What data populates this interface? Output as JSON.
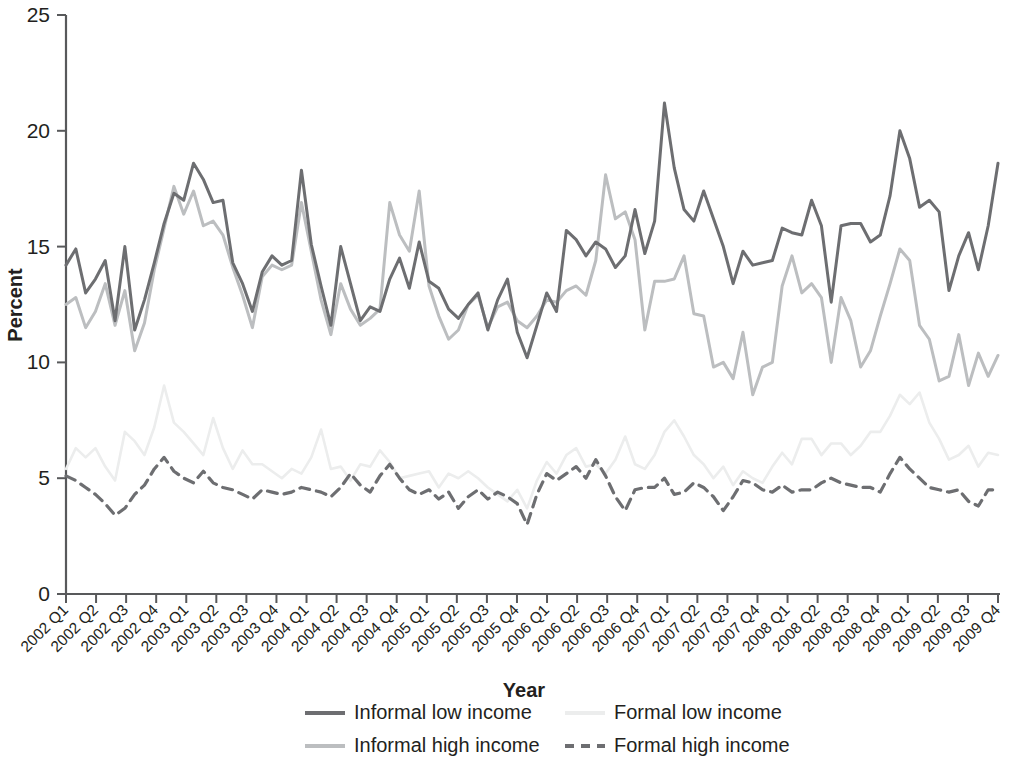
{
  "chart_data": {
    "type": "line",
    "title": "",
    "xlabel": "Year",
    "ylabel": "Percent",
    "ylim": [
      0,
      25
    ],
    "yticks": [
      0,
      5,
      10,
      15,
      20,
      25
    ],
    "grid": false,
    "legend_position": "bottom",
    "x_tick_labels": [
      "2002 Q1",
      "2002 Q2",
      "2002 Q3",
      "2002 Q4",
      "2003 Q1",
      "2003 Q2",
      "2003 Q3",
      "2003 Q4",
      "2004 Q1",
      "2004 Q2",
      "2004 Q3",
      "2004 Q4",
      "2005 Q1",
      "2005 Q2",
      "2005 Q3",
      "2005 Q4",
      "2006 Q1",
      "2006 Q2",
      "2006 Q3",
      "2006 Q4",
      "2007 Q1",
      "2007 Q2",
      "2007 Q3",
      "2007 Q4",
      "2008 Q1",
      "2008 Q2",
      "2008 Q3",
      "2008 Q4",
      "2009 Q1",
      "2009 Q2",
      "2009 Q3",
      "2009 Q4"
    ],
    "x_resolution_note": "monthly observations plotted; axis labelled by quarter",
    "series": [
      {
        "name": "Informal low income",
        "color": "#6d6e71",
        "width": 3.0,
        "dash": "none",
        "values": [
          14.2,
          14.9,
          13.0,
          13.6,
          14.4,
          11.8,
          15.0,
          11.4,
          12.7,
          14.3,
          16.0,
          17.3,
          17.0,
          18.6,
          17.9,
          16.9,
          17.0,
          14.3,
          13.4,
          12.2,
          13.9,
          14.6,
          14.2,
          14.4,
          18.3,
          15.1,
          13.3,
          11.6,
          15.0,
          13.4,
          11.8,
          12.4,
          12.2,
          13.6,
          14.5,
          13.2,
          15.2,
          13.5,
          13.2,
          12.3,
          11.9,
          12.5,
          13.0,
          11.4,
          12.7,
          13.6,
          11.3,
          10.2,
          11.6,
          13.0,
          12.2,
          15.7,
          15.3,
          14.6,
          15.2,
          14.9,
          14.1,
          14.6,
          16.6,
          14.7,
          16.1,
          21.2,
          18.4,
          16.6,
          16.1,
          17.4,
          16.2,
          15.0,
          13.4,
          14.8,
          14.2,
          14.3,
          14.4,
          15.8,
          15.6,
          15.5,
          17.0,
          15.9,
          12.6,
          15.9,
          16.0,
          16.0,
          15.2,
          15.5,
          17.2,
          20.0,
          18.8,
          16.7,
          17.0,
          16.5,
          13.1,
          14.6,
          15.6,
          14.0,
          15.9,
          18.6
        ]
      },
      {
        "name": "Informal high income",
        "color": "#bcbec0",
        "width": 3.0,
        "dash": "none",
        "values": [
          12.5,
          12.8,
          11.5,
          12.2,
          13.4,
          11.6,
          13.1,
          10.5,
          11.7,
          14.0,
          15.8,
          17.6,
          16.4,
          17.4,
          15.9,
          16.1,
          15.5,
          14.1,
          12.9,
          11.5,
          13.7,
          14.2,
          14.0,
          14.2,
          16.9,
          14.8,
          12.7,
          11.2,
          13.4,
          12.3,
          11.6,
          11.9,
          12.3,
          16.9,
          15.5,
          14.8,
          17.4,
          13.3,
          12.0,
          11.0,
          11.4,
          12.5,
          12.9,
          11.5,
          12.4,
          12.6,
          11.8,
          11.5,
          12.0,
          12.7,
          12.6,
          13.1,
          13.3,
          12.9,
          14.4,
          18.1,
          16.2,
          16.5,
          15.3,
          11.4,
          13.5,
          13.5,
          13.6,
          14.6,
          12.1,
          12.0,
          9.8,
          10.0,
          9.3,
          11.3,
          8.6,
          9.8,
          10.0,
          13.3,
          14.6,
          13.0,
          13.4,
          12.8,
          10.0,
          12.8,
          11.8,
          9.8,
          10.5,
          12.0,
          13.4,
          14.9,
          14.4,
          11.6,
          11.0,
          9.2,
          9.4,
          11.2,
          9.0,
          10.4,
          9.4,
          10.3
        ]
      },
      {
        "name": "Formal low income",
        "color": "#eceded",
        "width": 2.6,
        "dash": "none",
        "values": [
          5.4,
          6.3,
          5.9,
          6.3,
          5.5,
          4.9,
          7.0,
          6.6,
          6.0,
          7.2,
          9.0,
          7.4,
          7.0,
          6.5,
          6.0,
          7.6,
          6.3,
          5.4,
          6.2,
          5.6,
          5.6,
          5.3,
          5.0,
          5.4,
          5.2,
          5.9,
          7.1,
          5.4,
          5.5,
          4.9,
          5.6,
          5.5,
          6.2,
          5.7,
          5.0,
          5.1,
          5.2,
          5.3,
          4.6,
          5.2,
          5.0,
          5.3,
          5.0,
          4.6,
          4.3,
          4.0,
          4.5,
          3.7,
          4.9,
          5.7,
          5.2,
          6.0,
          6.3,
          5.5,
          5.6,
          5.2,
          5.8,
          6.8,
          5.6,
          5.4,
          6.0,
          7.0,
          7.5,
          6.8,
          6.0,
          5.6,
          5.0,
          5.5,
          4.7,
          5.3,
          5.0,
          4.8,
          5.5,
          6.1,
          5.6,
          6.7,
          6.7,
          6.0,
          6.5,
          6.5,
          6.0,
          6.4,
          7.0,
          7.0,
          7.7,
          8.6,
          8.2,
          8.7,
          7.4,
          6.7,
          5.8,
          6.0,
          6.4,
          5.5,
          6.1,
          6.0
        ]
      },
      {
        "name": "Formal high income",
        "color": "#6d6e71",
        "width": 3.2,
        "dash": "10 7",
        "values": [
          5.1,
          4.9,
          4.6,
          4.3,
          3.9,
          3.4,
          3.7,
          4.3,
          4.7,
          5.4,
          5.9,
          5.3,
          5.0,
          4.8,
          5.3,
          4.8,
          4.6,
          4.5,
          4.3,
          4.1,
          4.5,
          4.4,
          4.3,
          4.4,
          4.6,
          4.5,
          4.4,
          4.2,
          4.6,
          5.2,
          4.7,
          4.4,
          5.1,
          5.6,
          5.0,
          4.5,
          4.3,
          4.5,
          4.1,
          4.4,
          3.7,
          4.2,
          4.5,
          4.1,
          4.4,
          4.2,
          3.9,
          3.0,
          4.3,
          5.2,
          4.9,
          5.2,
          5.5,
          5.0,
          5.8,
          5.1,
          4.2,
          3.6,
          4.5,
          4.6,
          4.6,
          5.0,
          4.3,
          4.4,
          4.8,
          4.6,
          4.2,
          3.6,
          4.2,
          4.9,
          4.8,
          4.5,
          4.4,
          4.7,
          4.4,
          4.5,
          4.5,
          4.8,
          5.0,
          4.8,
          4.7,
          4.6,
          4.6,
          4.4,
          5.2,
          5.9,
          5.4,
          5.0,
          4.6,
          4.5,
          4.4,
          4.5,
          4.0,
          3.8,
          4.5,
          4.5
        ]
      }
    ]
  },
  "legend": {
    "items": [
      {
        "label": "Informal low income",
        "color": "#6d6e71",
        "dash": "none",
        "width": 4
      },
      {
        "label": "Formal low income",
        "color": "#eceded",
        "dash": "none",
        "width": 4
      },
      {
        "label": "Informal high income",
        "color": "#bcbec0",
        "dash": "none",
        "width": 4
      },
      {
        "label": "Formal high income",
        "color": "#6d6e71",
        "dash": "9 7",
        "width": 4
      }
    ]
  }
}
